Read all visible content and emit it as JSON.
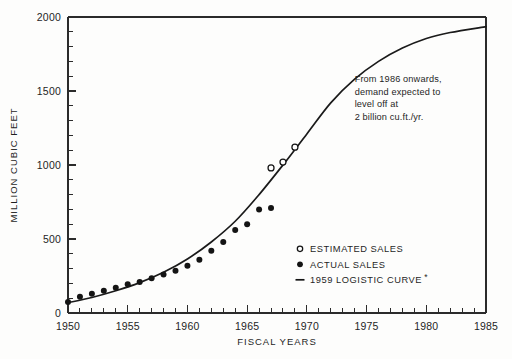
{
  "chart_data": {
    "type": "line",
    "title": "",
    "xlabel": "FISCAL YEARS",
    "ylabel": "MILLION CUBIC FEET",
    "xlim": [
      1950,
      1985
    ],
    "ylim": [
      0,
      2000
    ],
    "grid": false,
    "x_major_ticks": [
      1950,
      1955,
      1960,
      1965,
      1970,
      1975,
      1980,
      1985
    ],
    "x_major_tick_labels": [
      "1950",
      "1955",
      "1960",
      "1965",
      "1970",
      "1975",
      "1980",
      "1985"
    ],
    "x_minor_tick_step": 1,
    "y_major_ticks": [
      0,
      500,
      1000,
      1500,
      2000
    ],
    "y_major_tick_labels": [
      "0",
      "500",
      "1000",
      "1500",
      "2000"
    ],
    "y_minor_tick_step": 100,
    "legend_position": "lower-right-inside",
    "series": [
      {
        "name": "ACTUAL SALES",
        "marker": "filled-circle",
        "type": "scatter",
        "x": [
          1950,
          1951,
          1952,
          1953,
          1954,
          1955,
          1956,
          1957,
          1958,
          1959,
          1960,
          1961,
          1962,
          1963,
          1964,
          1965,
          1966,
          1967
        ],
        "values": [
          75,
          110,
          130,
          150,
          170,
          195,
          210,
          235,
          260,
          285,
          320,
          360,
          420,
          480,
          560,
          600,
          700,
          710
        ]
      },
      {
        "name": "ESTIMATED SALES",
        "marker": "open-circle",
        "type": "scatter",
        "x": [
          1967,
          1968,
          1969
        ],
        "values": [
          980,
          1020,
          1120
        ]
      },
      {
        "name": "1959 LOGISTIC CURVE",
        "marker": "line",
        "type": "line",
        "x": [
          1950,
          1952,
          1954,
          1956,
          1958,
          1960,
          1962,
          1964,
          1966,
          1968,
          1970,
          1972,
          1974,
          1976,
          1978,
          1980,
          1982,
          1985
        ],
        "values": [
          70,
          105,
          150,
          205,
          275,
          365,
          480,
          620,
          800,
          1000,
          1210,
          1420,
          1580,
          1700,
          1790,
          1855,
          1895,
          1935
        ]
      }
    ],
    "annotations": [
      {
        "name": "plateau-note",
        "lines": [
          "From 1986 onwards,",
          "demand expected to",
          "level off at",
          "2 billion cu.ft./yr."
        ],
        "x": 1974.0,
        "y": 1560
      }
    ]
  },
  "legend": {
    "items": [
      {
        "marker": "open-circle",
        "label": "ESTIMATED SALES"
      },
      {
        "marker": "filled-circle",
        "label": "ACTUAL SALES"
      },
      {
        "marker": "dash",
        "label": "1959 LOGISTIC CURVE",
        "suffix": "*"
      }
    ]
  },
  "axes": {
    "y_title": "MILLION CUBIC FEET",
    "x_title": "FISCAL YEARS"
  },
  "colors": {
    "ink": "#1a1a1a",
    "curve": "#141414",
    "background": "#fdfdfc",
    "marker_fill": "#141414",
    "marker_open_fill": "#ffffff"
  },
  "footnote": {
    "text": ""
  }
}
